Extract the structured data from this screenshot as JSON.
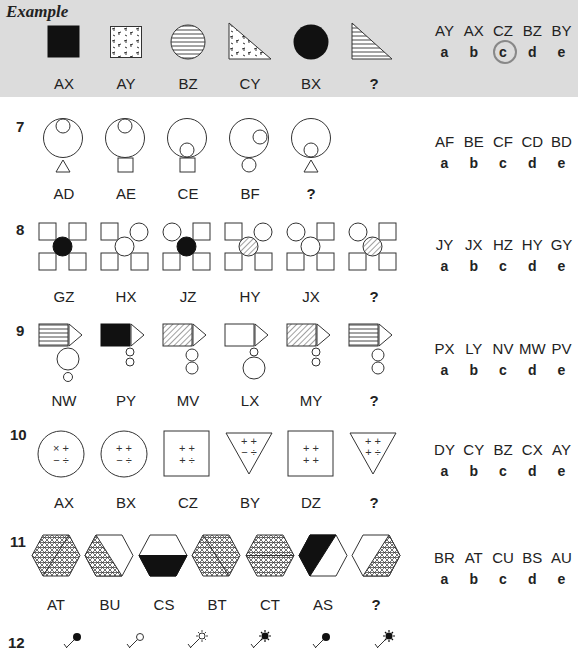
{
  "example": {
    "title": "Example",
    "figure_labels": [
      "AX",
      "AY",
      "BZ",
      "CY",
      "BX",
      "?"
    ],
    "figures": [
      "black-square",
      "speckled-square",
      "striped-circle",
      "speckled-triangle",
      "black-circle",
      "striped-triangle"
    ],
    "options": {
      "codes": [
        "AY",
        "AX",
        "CZ",
        "BZ",
        "BY"
      ],
      "letters": [
        "a",
        "b",
        "c",
        "d",
        "e"
      ],
      "selected": "c"
    }
  },
  "questions": [
    {
      "number": "7",
      "figure_labels": [
        "AD",
        "AE",
        "CE",
        "BF",
        "?"
      ],
      "figures": [
        "circle-small-top-triangle",
        "circle-small-top-square",
        "circle-small-bottom-square",
        "circle-small-right-circle-below",
        "circle-small-bottom-triangle"
      ],
      "options": {
        "codes": [
          "AF",
          "BE",
          "CF",
          "CD",
          "BD"
        ],
        "letters": [
          "a",
          "b",
          "c",
          "d",
          "e"
        ]
      }
    },
    {
      "number": "8",
      "figure_labels": [
        "GZ",
        "HX",
        "JZ",
        "HY",
        "JX",
        "?"
      ],
      "figures": [
        "four-squares-black-center",
        "four-squares-white-center-topright",
        "four-squares-black-center-topleft",
        "four-squares-hatched-center-topright",
        "four-squares-white-center-topleft",
        "four-squares-hatched-center-topleft"
      ],
      "options": {
        "codes": [
          "JY",
          "JX",
          "HZ",
          "HY",
          "GY"
        ],
        "letters": [
          "a",
          "b",
          "c",
          "d",
          "e"
        ]
      }
    },
    {
      "number": "9",
      "figure_labels": [
        "NW",
        "PY",
        "MV",
        "LX",
        "MY",
        "?"
      ],
      "figures": [
        "striped-rect-big-small",
        "black-rect-small-small",
        "hatched-rect-medium-medium",
        "white-rect-small-big",
        "hatched-rect-small-small",
        "striped-rect-medium-medium"
      ],
      "options": {
        "codes": [
          "PX",
          "LY",
          "NV",
          "MW",
          "PV"
        ],
        "letters": [
          "a",
          "b",
          "c",
          "d",
          "e"
        ]
      }
    },
    {
      "number": "10",
      "figure_labels": [
        "AX",
        "BX",
        "CZ",
        "BY",
        "DZ",
        "?"
      ],
      "figures": [
        "circle",
        "circle",
        "square",
        "triangle",
        "square",
        "triangle"
      ],
      "symbols": [
        [
          "×",
          "+",
          "−",
          "÷"
        ],
        [
          "+",
          "+",
          "−",
          "÷"
        ],
        [
          "+",
          "+",
          "+",
          "÷"
        ],
        [
          "+",
          "+",
          "−",
          "÷"
        ],
        [
          "+",
          "+",
          "+",
          "+"
        ],
        [
          "+",
          "+",
          "+",
          "÷"
        ]
      ],
      "options": {
        "codes": [
          "DY",
          "CY",
          "BZ",
          "CX",
          "AY"
        ],
        "letters": [
          "a",
          "b",
          "c",
          "d",
          "e"
        ]
      }
    },
    {
      "number": "11",
      "figure_labels": [
        "AT",
        "BU",
        "CS",
        "BT",
        "CT",
        "AS",
        "?"
      ],
      "figures": [
        "hex-crosshatch-diag-split",
        "hex-left-crosshatch",
        "hex-bottom-black",
        "hex-crosshatch-diag-split-2",
        "hex-crosshatch-horiz-split",
        "hex-left-black",
        "hex-right-crosshatch"
      ],
      "options": {
        "codes": [
          "BR",
          "AT",
          "CU",
          "BS",
          "AU"
        ],
        "letters": [
          "a",
          "b",
          "c",
          "d",
          "e"
        ]
      }
    },
    {
      "number": "12",
      "figures": [
        "stick-black-dot",
        "stick-white-dot",
        "stick-white-star",
        "stick-black-star",
        "stick-black-dot",
        "stick-black-star"
      ]
    }
  ]
}
